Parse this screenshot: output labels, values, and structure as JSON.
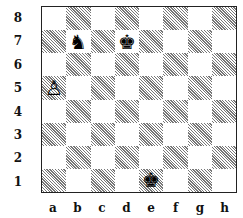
{
  "board": {
    "files": [
      "a",
      "b",
      "c",
      "d",
      "e",
      "f",
      "g",
      "h"
    ],
    "ranks": [
      "8",
      "7",
      "6",
      "5",
      "4",
      "3",
      "2",
      "1"
    ],
    "pieces": [
      {
        "square": "b7",
        "piece": "knight",
        "color": "black",
        "glyph": "♞"
      },
      {
        "square": "d7",
        "piece": "king",
        "color": "black",
        "glyph": "♚"
      },
      {
        "square": "a5",
        "piece": "pawn",
        "color": "white",
        "glyph": "♙"
      },
      {
        "square": "e1",
        "piece": "king",
        "color": "black",
        "glyph": "♚"
      }
    ]
  }
}
